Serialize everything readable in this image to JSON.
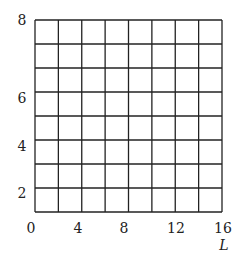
{
  "chart_data": {
    "type": "grid",
    "title": "",
    "xlabel": "L",
    "ylabel": "",
    "xlim": [
      0,
      16
    ],
    "ylim": [
      0,
      8
    ],
    "x_ticks": [
      "0",
      "4",
      "8",
      "12",
      "16"
    ],
    "y_ticks": [
      "2",
      "4",
      "6",
      "8"
    ],
    "grid": true,
    "grid_columns": 8,
    "grid_rows": 8,
    "series": []
  }
}
